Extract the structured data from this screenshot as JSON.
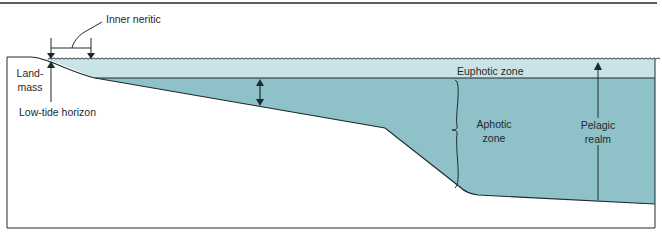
{
  "diagram": {
    "labels": {
      "inner_neritic": "Inner neritic",
      "landmass_line1": "Land-",
      "landmass_line2": "mass",
      "low_tide": "Low-tide horizon",
      "euphotic": "Euphotic zone",
      "aphotic_line1": "Aphotic",
      "aphotic_line2": "zone",
      "pelagic_line1": "Pelagic",
      "pelagic_line2": "realm"
    },
    "colors": {
      "euphotic_fill": "#c9e3e6",
      "aphotic_fill": "#8fc1c8",
      "line": "#1e2a30",
      "background": "#ffffff"
    }
  }
}
